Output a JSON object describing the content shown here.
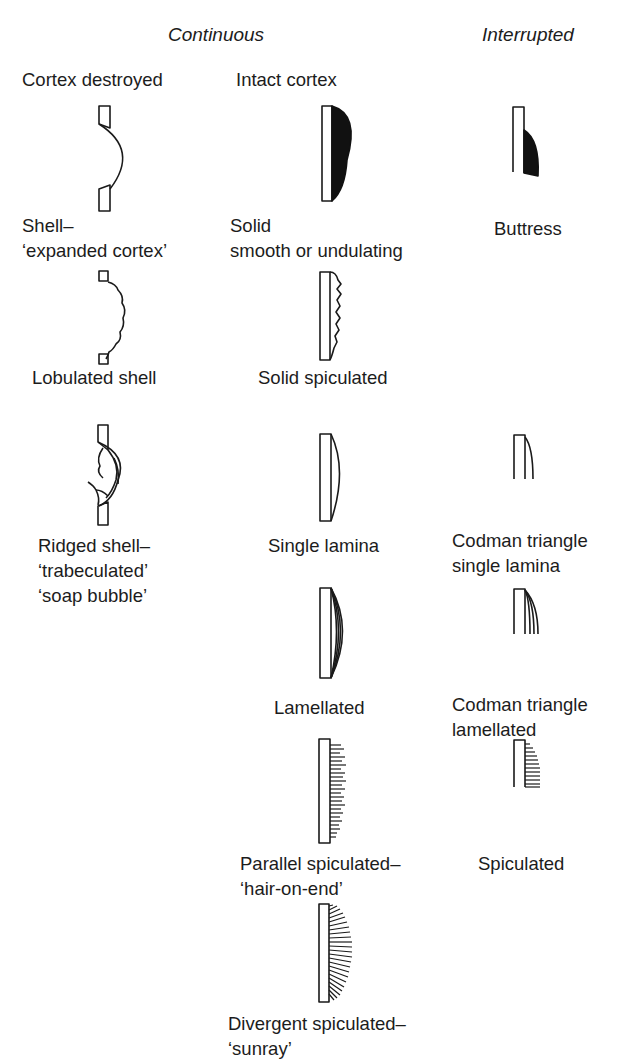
{
  "headers": {
    "continuous": "Continuous",
    "interrupted": "Interrupted"
  },
  "left_column": [
    {
      "label": "Cortex destroyed"
    },
    {
      "label": "Shell–",
      "label2": "‘expanded cortex’"
    },
    {
      "label": "Lobulated shell"
    },
    {
      "label": "Ridged shell–",
      "label2": "‘trabeculated’",
      "label3": "‘soap bubble’"
    }
  ],
  "middle_column": [
    {
      "label": "Intact cortex"
    },
    {
      "label": "Solid",
      "label2": "smooth or undulating"
    },
    {
      "label": "Solid spiculated"
    },
    {
      "label": "Single lamina"
    },
    {
      "label": "Lamellated"
    },
    {
      "label": "Parallel spiculated–",
      "label2": "‘hair-on-end’"
    },
    {
      "label": "Divergent spiculated–",
      "label2": "‘sunray’"
    }
  ],
  "right_column": [
    {
      "label": "Buttress"
    },
    {
      "label": "Codman triangle",
      "label2": "single lamina"
    },
    {
      "label": "Codman triangle",
      "label2": "lamellated"
    },
    {
      "label": "Spiculated"
    }
  ],
  "colors": {
    "ink": "#1a1a1a",
    "background": "#ffffff"
  }
}
